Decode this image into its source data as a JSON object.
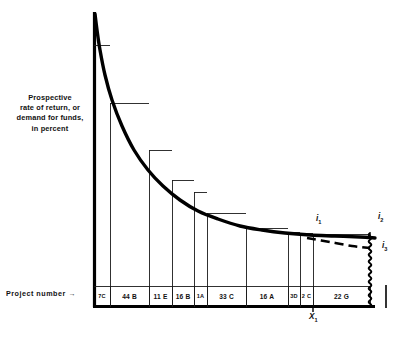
{
  "figure": {
    "y_axis_label_lines": [
      "Prospective",
      "rate of return, or",
      "demand  for funds,",
      "in   percent"
    ],
    "x_axis_label": "Project  number",
    "x_axis_label_arrow": "→"
  },
  "markers": {
    "i1": {
      "text": "i",
      "sub": "1"
    },
    "i2": {
      "text": "i",
      "sub": "2"
    },
    "i3": {
      "text": "i",
      "sub": "3"
    },
    "x1": {
      "text": "X",
      "sub": "1"
    }
  },
  "colors": {
    "ink": "#111111",
    "curve": "#000000",
    "step": "#1a1a1a",
    "background": "#ffffff"
  },
  "chart_data": {
    "type": "bar",
    "title": "",
    "subtitle": "",
    "xlabel": "Project  number",
    "ylabel": "Prospective rate of return, or demand for funds, in percent",
    "grid": false,
    "legend": "none",
    "axis_note": "Axes are unscaled (no numeric tick labels shown); values below are read off pixel geometry as relative heights.",
    "xlim": [
      0,
      281
    ],
    "ylim": [
      0,
      294
    ],
    "categories": [
      "7C",
      "44 B",
      "11 E",
      "16 B",
      "1A",
      "33 C",
      "16 A",
      "3D",
      "2 C",
      "22 G"
    ],
    "bar_left_px": [
      94,
      110,
      149,
      172,
      194,
      207,
      246,
      288,
      300,
      313
    ],
    "bar_right_px": [
      110,
      149,
      172,
      194,
      207,
      246,
      288,
      300,
      313,
      370
    ],
    "bar_widths_px": [
      16,
      39,
      23,
      22,
      13,
      39,
      42,
      12,
      13,
      57
    ],
    "bar_top_px": [
      45,
      103,
      150,
      180,
      192,
      213,
      228,
      232,
      233,
      234
    ],
    "values": [
      262,
      204,
      157,
      127,
      115,
      94,
      79,
      75,
      74,
      73
    ],
    "baseline_px": 307,
    "annotations": [
      {
        "name": "i1",
        "label": "i₁",
        "x_px": 318,
        "y_px": 222,
        "note": "interest rate level at cutoff X₁"
      },
      {
        "name": "i2",
        "label": "i₂",
        "x_px": 380,
        "y_px": 220,
        "note": "higher rate at right end of solid curve"
      },
      {
        "name": "i3",
        "label": "i₃",
        "x_px": 380,
        "y_px": 247,
        "note": "lower rate at right end of dashed curve"
      },
      {
        "name": "x1",
        "label": "X₁",
        "x_px": 313,
        "y_px": 318,
        "note": "cutoff quantity of investment on horizontal axis"
      }
    ],
    "curve": {
      "kind": "smooth-declining-demand-curve",
      "description": "Heavy smooth convex curve traced through the step tops from upper-left to lower-right, flattening toward the right.",
      "points_px": [
        [
          95,
          14
        ],
        [
          97,
          30
        ],
        [
          100,
          50
        ],
        [
          105,
          75
        ],
        [
          112,
          100
        ],
        [
          122,
          126
        ],
        [
          134,
          150
        ],
        [
          148,
          170
        ],
        [
          163,
          186
        ],
        [
          180,
          200
        ],
        [
          198,
          211
        ],
        [
          218,
          219
        ],
        [
          240,
          226
        ],
        [
          262,
          230
        ],
        [
          285,
          233
        ],
        [
          310,
          235
        ],
        [
          335,
          236
        ],
        [
          360,
          237
        ],
        [
          375,
          238
        ]
      ]
    },
    "dashed_curve": {
      "kind": "alternative-schedule",
      "description": "Short dashed segment branching from the solid curve near X₁ and sloping down to i₃ at the right edge.",
      "points_px": [
        [
          307,
          238
        ],
        [
          330,
          242
        ],
        [
          352,
          246
        ],
        [
          370,
          248
        ]
      ]
    },
    "wavy_divider": {
      "description": "Squiggly vertical break line at the right edge of the 22 G bar indicating the axis is broken / continues.",
      "x_px": 370,
      "y_top_px": 233,
      "y_bottom_px": 307
    },
    "right_tick": {
      "description": "Short isolated vertical tick beyond the break.",
      "x_px": 386,
      "y_top_px": 285,
      "y_bottom_px": 308
    }
  }
}
